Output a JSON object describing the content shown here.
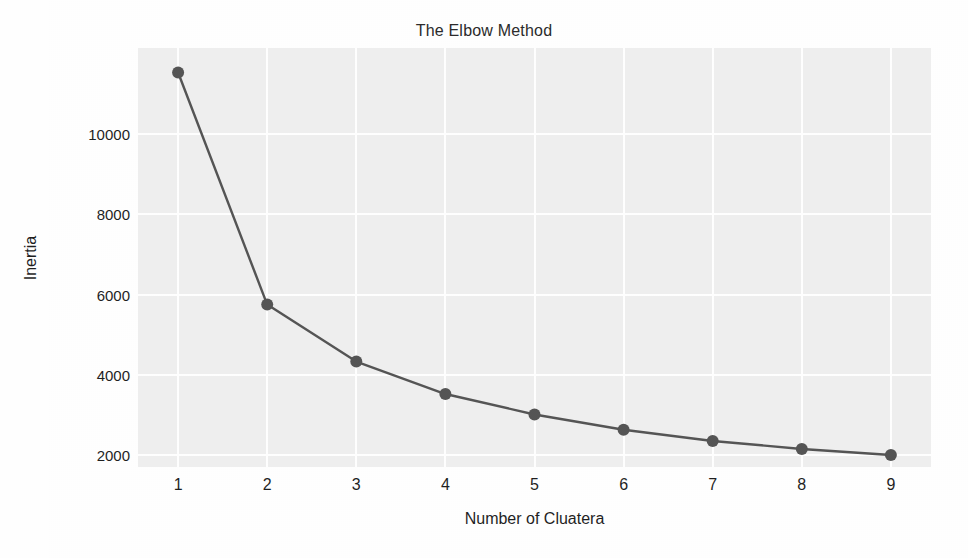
{
  "chart_data": {
    "type": "line",
    "title": "The Elbow Method",
    "xlabel": "Number of Cluatera",
    "ylabel": "Inertia",
    "x": [
      1,
      2,
      3,
      4,
      5,
      6,
      7,
      8,
      9
    ],
    "values": [
      11540,
      5750,
      4330,
      3520,
      3010,
      2630,
      2350,
      2150,
      2000
    ],
    "xtick_labels": [
      "1",
      "2",
      "3",
      "4",
      "5",
      "6",
      "7",
      "8",
      "9"
    ],
    "ytick_labels": [
      "2000",
      "4000",
      "6000",
      "8000",
      "10000"
    ],
    "ytick_values": [
      2000,
      4000,
      6000,
      8000,
      10000
    ],
    "xlim": [
      0.55,
      9.45
    ],
    "ylim": [
      1700,
      12150
    ],
    "grid": true,
    "legend": "none",
    "marker": "circle",
    "line_color": "#555555",
    "marker_color": "#555555",
    "plot_background": "#efefef",
    "gridline_color": "#ffffff",
    "figure_background": "#ffffff"
  }
}
